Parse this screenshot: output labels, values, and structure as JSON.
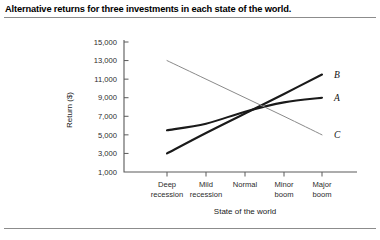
{
  "caption": "Alternative returns for three investments in each state of the world.",
  "chart_data": {
    "type": "line",
    "title": "Alternative returns for three investments in each state of the world.",
    "xlabel": "State of the world",
    "ylabel": "Return ($)",
    "categories": [
      "Deep recession",
      "Mild recession",
      "Normal",
      "Minor boom",
      "Major boom"
    ],
    "category_lines": [
      [
        "Deep",
        "recession"
      ],
      [
        "Mild",
        "recession"
      ],
      [
        "Normal",
        ""
      ],
      [
        "Minor",
        "boom"
      ],
      [
        "Major",
        "boom"
      ]
    ],
    "ylim": [
      1000,
      15000
    ],
    "yticks": [
      1000,
      3000,
      5000,
      7000,
      9000,
      11000,
      13000,
      15000
    ],
    "ytick_labels": [
      "1,000",
      "3,000",
      "5,000",
      "7,000",
      "9,000",
      "11,000",
      "13,000",
      "15,000"
    ],
    "grid": false,
    "legend": "inline-end-labels",
    "series": [
      {
        "name": "A",
        "label": "A",
        "color": "#1a1a1a",
        "width": 2.1,
        "values": [
          5500,
          6200,
          7500,
          8500,
          9000
        ]
      },
      {
        "name": "B",
        "label": "B",
        "color": "#1a1a1a",
        "width": 2.1,
        "values": [
          3000,
          5200,
          7300,
          9400,
          11500
        ]
      },
      {
        "name": "C",
        "label": "C",
        "color": "#8a8a8a",
        "width": 1.0,
        "values": [
          13000,
          11000,
          9000,
          7000,
          5000
        ]
      }
    ]
  },
  "colors": {
    "rule": "#8c8c8c",
    "axis": "#5a5a5a",
    "text": "#1a1a1a",
    "series_dark": "#1a1a1a",
    "series_light": "#8a8a8a",
    "background": "#ffffff"
  }
}
